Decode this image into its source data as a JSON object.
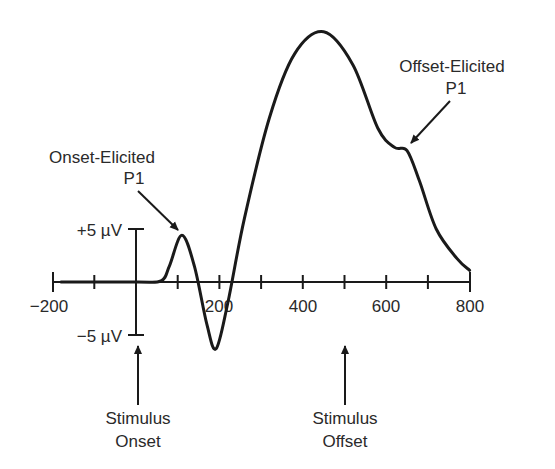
{
  "chart_data": {
    "type": "line",
    "title": "",
    "xlabel": "",
    "ylabel": "",
    "xlim": [
      -200,
      800
    ],
    "ylim": [
      -5,
      5
    ],
    "grid": false,
    "x_ticks": [
      -200,
      -100,
      0,
      100,
      200,
      300,
      400,
      500,
      600,
      700,
      800
    ],
    "x_tick_labels": [
      "−200",
      "200",
      "400",
      "600",
      "800"
    ],
    "y_tick_labels": [
      "+5 µV",
      "−5 µV"
    ],
    "series": [
      {
        "name": "ERP waveform",
        "x": [
          -180,
          0,
          60,
          80,
          110,
          140,
          170,
          192,
          220,
          260,
          320,
          380,
          450,
          520,
          580,
          620,
          650,
          680,
          720,
          770,
          800
        ],
        "y": [
          0,
          0,
          0.1,
          1.5,
          4.4,
          1.5,
          -4.0,
          -6.3,
          -2.0,
          6.0,
          15.5,
          21.5,
          23.6,
          20.5,
          14.5,
          12.7,
          12.4,
          9.5,
          5.0,
          2.2,
          1.1
        ]
      }
    ],
    "annotations": [
      {
        "text": [
          "Onset-Elicited",
          "P1"
        ],
        "x": 110,
        "y": 4.4
      },
      {
        "text": [
          "Offset-Elicited",
          "P1"
        ],
        "x": 640,
        "y": 12.5
      },
      {
        "text": [
          "Stimulus",
          "Onset"
        ],
        "x": 0
      },
      {
        "text": [
          "Stimulus",
          "Offset"
        ],
        "x": 500
      }
    ]
  },
  "labels": {
    "onset_p1_line1": "Onset-Elicited",
    "onset_p1_line2": "P1",
    "offset_p1_line1": "Offset-Elicited",
    "offset_p1_line2": "P1",
    "stim_onset_line1": "Stimulus",
    "stim_onset_line2": "Onset",
    "stim_offset_line1": "Stimulus",
    "stim_offset_line2": "Offset",
    "y_pos": "+5 µV",
    "y_neg": "−5 µV",
    "x_m200": "−200",
    "x_200": "200",
    "x_400": "400",
    "x_600": "600",
    "x_800": "800"
  }
}
